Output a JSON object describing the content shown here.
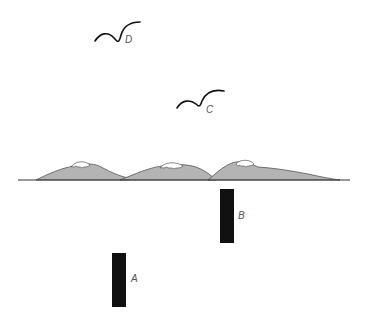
{
  "diagram": {
    "birds": [
      {
        "label": "D"
      },
      {
        "label": "C"
      }
    ],
    "bars": [
      {
        "label": "B"
      },
      {
        "label": "A"
      }
    ],
    "colors": {
      "hill_fill": "#b4b4b4",
      "snow": "#ffffff",
      "outline": "#333333",
      "bar": "#111111",
      "background": "#ffffff"
    }
  }
}
